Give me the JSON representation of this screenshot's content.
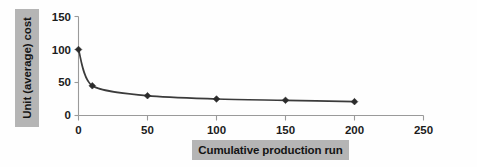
{
  "chart_data": {
    "type": "line",
    "title": "",
    "subtitle": "",
    "xlabel": "Cumulative production run",
    "ylabel": "Unit (average) cost",
    "x": [
      0,
      10,
      50,
      100,
      150,
      200
    ],
    "values": [
      100,
      45,
      30,
      25,
      23,
      21
    ],
    "series": [
      {
        "name": "Unit (average) cost",
        "x": [
          0,
          10,
          50,
          100,
          150,
          200
        ],
        "values": [
          100,
          45,
          30,
          25,
          23,
          21
        ]
      }
    ],
    "xlim": [
      0,
      250
    ],
    "ylim": [
      0,
      150
    ],
    "xticks": [
      0,
      50,
      100,
      150,
      200,
      250
    ],
    "yticks": [
      0,
      50,
      100,
      150
    ],
    "xtick_labels": [
      "0",
      "50",
      "100",
      "150",
      "200",
      "250"
    ],
    "ytick_labels": [
      "0",
      "50",
      "100",
      "150"
    ],
    "grid": false,
    "legend": false,
    "legend_position": "none",
    "marker": "diamond",
    "annotations": []
  },
  "axes": {
    "y": {
      "label": "Unit (average) cost",
      "ticks": [
        {
          "value": 150,
          "label": "150"
        },
        {
          "value": 100,
          "label": "100"
        },
        {
          "value": 50,
          "label": "50"
        },
        {
          "value": 0,
          "label": "0"
        }
      ]
    },
    "x": {
      "label": "Cumulative production run",
      "ticks": [
        {
          "value": 0,
          "label": "0"
        },
        {
          "value": 50,
          "label": "50"
        },
        {
          "value": 100,
          "label": "100"
        },
        {
          "value": 150,
          "label": "150"
        },
        {
          "value": 200,
          "label": "200"
        },
        {
          "value": 250,
          "label": "250"
        }
      ]
    }
  },
  "colors": {
    "label_plate": "#b5b5b5",
    "label_text": "#141414",
    "axis": "#9a9a9a",
    "curve": "#3b3b3b",
    "marker": "#2b2b2b",
    "background": "#fefefe"
  }
}
